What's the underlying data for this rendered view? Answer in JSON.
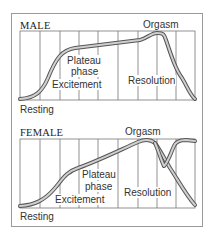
{
  "diagram": {
    "male": {
      "title": "MALE",
      "labels": {
        "orgasm": "Orgasm",
        "plateau_1": "Plateau",
        "plateau_2": "phase",
        "excitement": "Excitement",
        "resolution": "Resolution",
        "resting": "Resting"
      }
    },
    "female": {
      "title": "FEMALE",
      "labels": {
        "orgasm": "Orgasm",
        "plateau_1": "Plateau",
        "plateau_2": "phase",
        "excitement": "Excitement",
        "resolution": "Resolution",
        "resting": "Resting"
      }
    },
    "colors": {
      "curve_outline": "#555555",
      "curve_fill": "#c8c8c8",
      "grid": "#777777",
      "frame": "#9a9a9a"
    }
  }
}
